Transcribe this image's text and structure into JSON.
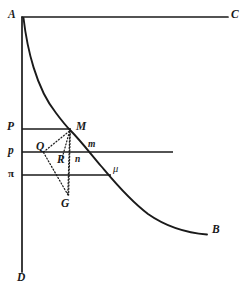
{
  "figure": {
    "type": "line-diagram",
    "canvas": {
      "width": 251,
      "height": 295,
      "background": "#ffffff"
    },
    "ink_color": "#1a1a1a",
    "labels": {
      "A": "A",
      "B": "B",
      "C": "C",
      "D": "D",
      "P_upper": "P",
      "p_middle": "p",
      "pi_lower": "π",
      "M": "M",
      "Q": "Q",
      "R": "R",
      "G": "G",
      "m": "m",
      "n": "n",
      "mu": "μ"
    },
    "label_positions": {
      "A": {
        "x": 8,
        "y": 9
      },
      "C": {
        "x": 231,
        "y": 9
      },
      "B": {
        "x": 212,
        "y": 224
      },
      "D": {
        "x": 17,
        "y": 272
      },
      "P_upper": {
        "x": 7,
        "y": 120
      },
      "p_middle": {
        "x": 8,
        "y": 144
      },
      "pi_lower": {
        "x": 8,
        "y": 167
      },
      "M": {
        "x": 76,
        "y": 121
      },
      "Q": {
        "x": 36,
        "y": 141
      },
      "R": {
        "x": 57,
        "y": 153
      },
      "G": {
        "x": 61,
        "y": 197
      },
      "m": {
        "x": 88,
        "y": 140
      },
      "n": {
        "x": 75,
        "y": 154
      },
      "mu": {
        "x": 113,
        "y": 163
      }
    },
    "points": {
      "origin_A": {
        "x": 22,
        "y": 17
      },
      "axis_C_end": {
        "x": 228,
        "y": 17
      },
      "axis_D_end": {
        "x": 22,
        "y": 272
      },
      "M": {
        "x": 70,
        "y": 130
      },
      "Q": {
        "x": 43,
        "y": 152
      },
      "R": {
        "x": 70,
        "y": 152
      },
      "G": {
        "x": 68,
        "y": 196
      },
      "mu": {
        "x": 110,
        "y": 175
      },
      "curve_end_B": {
        "x": 207,
        "y": 234
      }
    },
    "solid_lines": [
      {
        "name": "axis-AC",
        "from": {
          "x": 22,
          "y": 17
        },
        "to": {
          "x": 228,
          "y": 17
        },
        "width": 1.6
      },
      {
        "name": "axis-AD",
        "from": {
          "x": 22,
          "y": 17
        },
        "to": {
          "x": 22,
          "y": 272
        },
        "width": 1.6
      },
      {
        "name": "price-line-P",
        "from": {
          "x": 22,
          "y": 129
        },
        "to": {
          "x": 71,
          "y": 129
        },
        "width": 1.6
      },
      {
        "name": "price-line-p",
        "from": {
          "x": 22,
          "y": 152
        },
        "to": {
          "x": 173,
          "y": 152
        },
        "width": 1.6
      },
      {
        "name": "price-line-pi",
        "from": {
          "x": 22,
          "y": 175
        },
        "to": {
          "x": 111,
          "y": 175
        },
        "width": 1.6
      }
    ],
    "curve": {
      "name": "demand-curve-AB",
      "description": "hyperbolic curve from A through M and mu to B",
      "path": "M 24 19 C 30 62, 44 100, 70 130 C 92 156, 130 196, 207 234",
      "width": 1.8
    },
    "dotted_lines": [
      {
        "name": "dotted-QM",
        "from": {
          "x": 43,
          "y": 152
        },
        "to": {
          "x": 70,
          "y": 131
        }
      },
      {
        "name": "dotted-QG",
        "from": {
          "x": 43,
          "y": 152
        },
        "to": {
          "x": 68,
          "y": 196
        }
      },
      {
        "name": "dotted-MG-slanted",
        "from": {
          "x": 70,
          "y": 131
        },
        "to": {
          "x": 68,
          "y": 196
        }
      },
      {
        "name": "dotted-Mn-vertical",
        "from": {
          "x": 70,
          "y": 130
        },
        "to": {
          "x": 70,
          "y": 196
        }
      },
      {
        "name": "dotted-MR-inner",
        "from": {
          "x": 70,
          "y": 131
        },
        "to": {
          "x": 62,
          "y": 160
        }
      }
    ]
  }
}
